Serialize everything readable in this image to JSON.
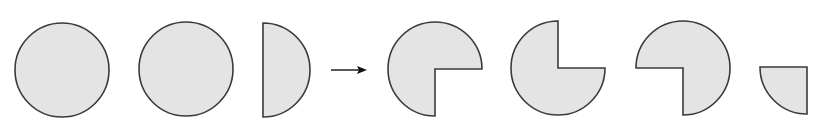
{
  "diagram": {
    "colors": {
      "fill": "#e4e4e4",
      "stroke": "#3a3a3a",
      "background": "#ffffff"
    },
    "stroke_width": 1.6,
    "radius": 47,
    "shapes": [
      {
        "id": "circle-1",
        "type": "full-circle",
        "cx": 62,
        "cy": 70
      },
      {
        "id": "circle-2",
        "type": "full-circle",
        "cx": 186,
        "cy": 69
      },
      {
        "id": "half-circle",
        "type": "half-circle-right",
        "cx": 263,
        "cy": 70
      },
      {
        "id": "arrow",
        "type": "arrow-right",
        "x1": 331,
        "x2": 367,
        "y": 70
      },
      {
        "id": "three-quarter-1",
        "type": "three-quarter",
        "missing_quadrant": "bottom-right",
        "cx": 435,
        "cy": 69
      },
      {
        "id": "three-quarter-2",
        "type": "three-quarter",
        "missing_quadrant": "top-right",
        "cx": 558,
        "cy": 68
      },
      {
        "id": "three-quarter-3",
        "type": "three-quarter",
        "missing_quadrant": "bottom-left",
        "cx": 683,
        "cy": 68
      },
      {
        "id": "quarter",
        "type": "quarter",
        "quadrant": "bottom-left",
        "cx": 807,
        "cy": 67
      }
    ]
  }
}
